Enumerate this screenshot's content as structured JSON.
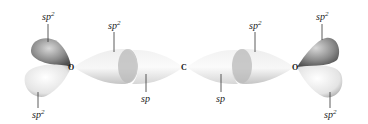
{
  "diagram": {
    "atoms": [
      {
        "id": "O_left",
        "label": "O"
      },
      {
        "id": "C_center",
        "label": "C"
      },
      {
        "id": "O_right",
        "label": "O"
      }
    ],
    "labels": {
      "left_top": "sp2",
      "left_bottom": "sp2",
      "left_bond": "sp2",
      "left_center": "sp",
      "right_center": "sp",
      "right_bond": "sp2",
      "right_top": "sp2",
      "right_bottom": "sp2"
    },
    "colors": {
      "dark_lobe": "#7a7a7a",
      "light_lobe": "#e6e6e6",
      "label_text": "#222222"
    }
  }
}
